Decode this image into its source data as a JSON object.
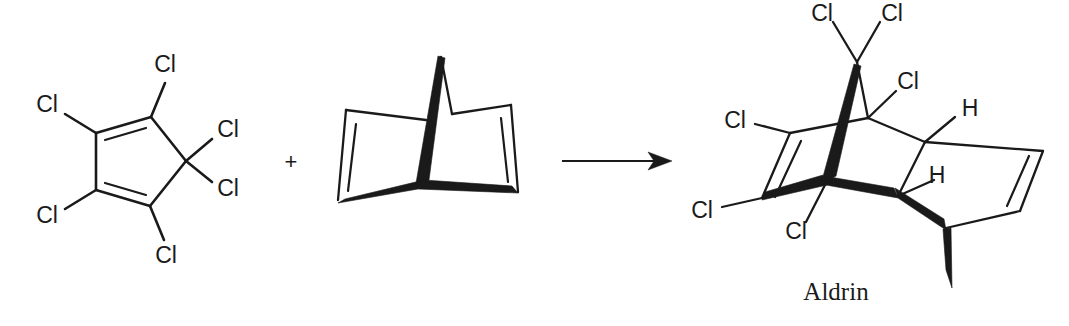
{
  "scheme": {
    "title": "Diels-Alder reaction scheme",
    "plus_sign": "+",
    "arrow": "reaction-arrow"
  },
  "reactant_1": {
    "name": "hexachlorocyclopentadiene",
    "labels": {
      "cl_top": "Cl",
      "cl_upper_left": "Cl",
      "cl_lower_left": "Cl",
      "cl_bottom": "Cl",
      "cl_right_upper": "Cl",
      "cl_right_lower": "Cl"
    }
  },
  "reactant_2": {
    "name": "norbornadiene",
    "labels": {}
  },
  "product": {
    "name_label": "Aldrin",
    "labels": {
      "cl_bridge_left": "Cl",
      "cl_bridge_right": "Cl",
      "cl_inner": "Cl",
      "cl_vinyl_upper": "Cl",
      "cl_vinyl_lower": "Cl",
      "cl_quaternary": "Cl",
      "h_upper": "H",
      "h_lower": "H"
    }
  },
  "colors": {
    "ink": "#1a1a1a",
    "background": "#ffffff"
  }
}
